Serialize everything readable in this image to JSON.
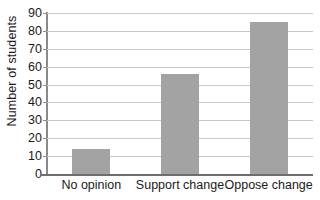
{
  "chart_data": {
    "type": "bar",
    "title": "",
    "xlabel": "",
    "ylabel": "Number of students",
    "categories": [
      "No opinion",
      "Support change",
      "Oppose change"
    ],
    "values": [
      14,
      56,
      85
    ],
    "ylim": [
      0,
      90
    ],
    "yticks": [
      0,
      10,
      20,
      30,
      40,
      50,
      60,
      70,
      80,
      90
    ],
    "ytick_labels": [
      "0",
      "10",
      "20",
      "30",
      "40",
      "50",
      "60",
      "70",
      "80",
      "90"
    ],
    "grid": true,
    "legend": false,
    "bar_color": "#a3a3a3",
    "gridline_color": "#c8c8c8",
    "axis_color": "#8a8a8a",
    "background_color": "#ffffff"
  },
  "axes": {
    "y_title": "Number of students"
  }
}
